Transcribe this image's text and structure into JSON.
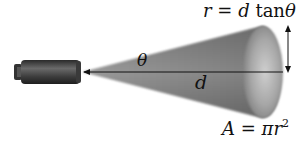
{
  "diagram": {
    "labels": {
      "angle": "θ",
      "distance": "d",
      "radius_formula": {
        "lhs": "r",
        "eq": " = ",
        "d": "d",
        "fn": " tan",
        "theta": "θ"
      },
      "area_formula": {
        "lhs": "A",
        "eq": " = ",
        "pi": "π",
        "r": "r",
        "exp": "2"
      }
    },
    "elements": [
      {
        "name": "camera",
        "shape": "cylinder"
      },
      {
        "name": "view-cone",
        "shape": "cone"
      },
      {
        "name": "distance-arrow",
        "from": "cone-base",
        "to": "camera"
      },
      {
        "name": "radius-arrow",
        "type": "double-headed"
      }
    ],
    "colors": {
      "background": "#ffffff",
      "cone": "#8a8a8a",
      "camera": "#4a4a4a",
      "line": "#111111"
    }
  }
}
